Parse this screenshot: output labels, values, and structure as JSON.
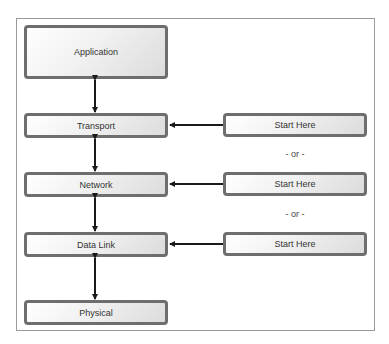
{
  "diagram": {
    "layers": [
      {
        "id": "application",
        "label": "Application"
      },
      {
        "id": "transport",
        "label": "Transport"
      },
      {
        "id": "network",
        "label": "Network"
      },
      {
        "id": "data-link",
        "label": "Data Link"
      },
      {
        "id": "physical",
        "label": "Physical"
      }
    ],
    "start_points": [
      {
        "label": "Start Here",
        "target": "Transport"
      },
      {
        "label": "Start Here",
        "target": "Network"
      },
      {
        "label": "Start Here",
        "target": "Data Link"
      }
    ],
    "separators": [
      "- or -",
      "- or -"
    ]
  },
  "colors": {
    "box_border": "#6e6e6e",
    "arrow": "#1a1a1a",
    "frame_border": "#9a9a9a"
  }
}
